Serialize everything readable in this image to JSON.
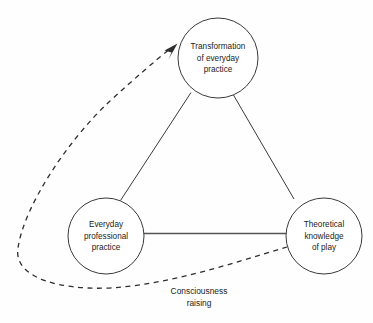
{
  "diagram": {
    "background_color": "#fefefe",
    "stroke_color": "#3a3a3a",
    "text_color": "#1c1c1c",
    "nodes": [
      {
        "id": "transformation",
        "lines": [
          "Transformation",
          "of everyday",
          "practice"
        ],
        "line1": "Transformation",
        "line2": "of everyday",
        "line3": "practice",
        "cx": 218,
        "cy": 58,
        "r": 40
      },
      {
        "id": "everyday-practice",
        "lines": [
          "Everyday",
          "professional",
          "practice"
        ],
        "line1": "Everyday",
        "line2": "professional",
        "line3": "practice",
        "cx": 106,
        "cy": 236,
        "r": 38
      },
      {
        "id": "theoretical-knowledge",
        "lines": [
          "Theoretical",
          "knowledge",
          "of play"
        ],
        "line1": "Theoretical",
        "line2": "knowledge",
        "line3": "of play",
        "cx": 324,
        "cy": 236,
        "r": 38
      }
    ],
    "edges": [
      {
        "id": "left-to-top",
        "style": "solid",
        "from": "everyday-practice",
        "to": "transformation"
      },
      {
        "id": "top-to-right",
        "style": "solid",
        "from": "transformation",
        "to": "theoretical-knowledge"
      },
      {
        "id": "left-to-right",
        "style": "solid",
        "from": "everyday-practice",
        "to": "theoretical-knowledge"
      },
      {
        "id": "consciousness-raising",
        "style": "dashed",
        "from": "theoretical-knowledge",
        "to": "transformation",
        "arrow": true
      }
    ],
    "edge_label": {
      "line1": "Consciousness",
      "line2": "raising"
    }
  }
}
